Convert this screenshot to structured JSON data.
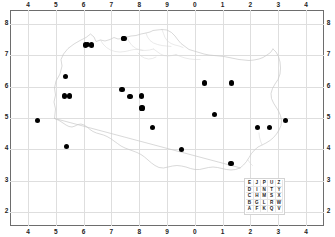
{
  "figure": {
    "title": "",
    "kind": "distribution-dot-map",
    "region_name": "Poland"
  },
  "axes": {
    "top_ticks": [
      "4",
      "5",
      "6",
      "7",
      "8",
      "9",
      "0",
      "1",
      "2",
      "3",
      "4"
    ],
    "bottom_ticks": [
      "4",
      "5",
      "6",
      "7",
      "8",
      "9",
      "0",
      "1",
      "2",
      "3",
      "4"
    ],
    "left_ticks": [
      "8",
      "7",
      "6",
      "5",
      "4",
      "3",
      "2"
    ],
    "right_ticks": [
      "8",
      "7",
      "6",
      "5",
      "4",
      "3",
      "2"
    ],
    "grid": true,
    "grid_color": "#dedede",
    "frame_color": "#6d6d6d",
    "label_color": "#1d1d1d"
  },
  "legend": {
    "name": "mgrs-100km-letter-grid",
    "rows": [
      [
        "E",
        "J",
        "P",
        "U",
        "Z"
      ],
      [
        "D",
        "I",
        "N",
        "T",
        "Y"
      ],
      [
        "C",
        "H",
        "M",
        "S",
        "X"
      ],
      [
        "B",
        "G",
        "L",
        "R",
        "W"
      ],
      [
        "A",
        "F",
        "K",
        "Q",
        "V"
      ]
    ]
  },
  "chart_data": {
    "type": "scatter",
    "title": "",
    "xlabel": "",
    "ylabel": "",
    "grid": true,
    "legend_position": "bottom-right",
    "x_tick_labels": [
      "4",
      "5",
      "6",
      "7",
      "8",
      "9",
      "0",
      "1",
      "2",
      "3",
      "4"
    ],
    "y_tick_labels": [
      "8",
      "7",
      "6",
      "5",
      "4",
      "3",
      "2"
    ],
    "xlim": [
      4,
      14
    ],
    "ylim": [
      2,
      8
    ],
    "marker": "filled-circle",
    "marker_color": "#000000",
    "marker_size_px": 5.2,
    "point_count": 23,
    "points": [
      {
        "gx": 6.07,
        "gy": 7.33
      },
      {
        "gx": 6.28,
        "gy": 7.33
      },
      {
        "gx": 7.45,
        "gy": 7.55
      },
      {
        "gx": 5.35,
        "gy": 6.32
      },
      {
        "gx": 7.38,
        "gy": 5.9
      },
      {
        "gx": 10.35,
        "gy": 6.12
      },
      {
        "gx": 11.32,
        "gy": 6.12
      },
      {
        "gx": 5.32,
        "gy": 5.7
      },
      {
        "gx": 5.48,
        "gy": 5.7
      },
      {
        "gx": 7.67,
        "gy": 5.68
      },
      {
        "gx": 8.07,
        "gy": 5.7
      },
      {
        "gx": 8.1,
        "gy": 5.32
      },
      {
        "gx": 10.72,
        "gy": 5.1
      },
      {
        "gx": 4.33,
        "gy": 4.92
      },
      {
        "gx": 13.25,
        "gy": 4.92
      },
      {
        "gx": 8.47,
        "gy": 4.7
      },
      {
        "gx": 12.27,
        "gy": 4.7
      },
      {
        "gx": 12.7,
        "gy": 4.7
      },
      {
        "gx": 5.38,
        "gy": 4.08
      },
      {
        "gx": 9.52,
        "gy": 4.0
      },
      {
        "gx": 11.3,
        "gy": 3.55
      },
      {
        "gx": 6.15,
        "gy": 7.34
      },
      {
        "gx": 7.44,
        "gy": 7.54
      }
    ]
  }
}
